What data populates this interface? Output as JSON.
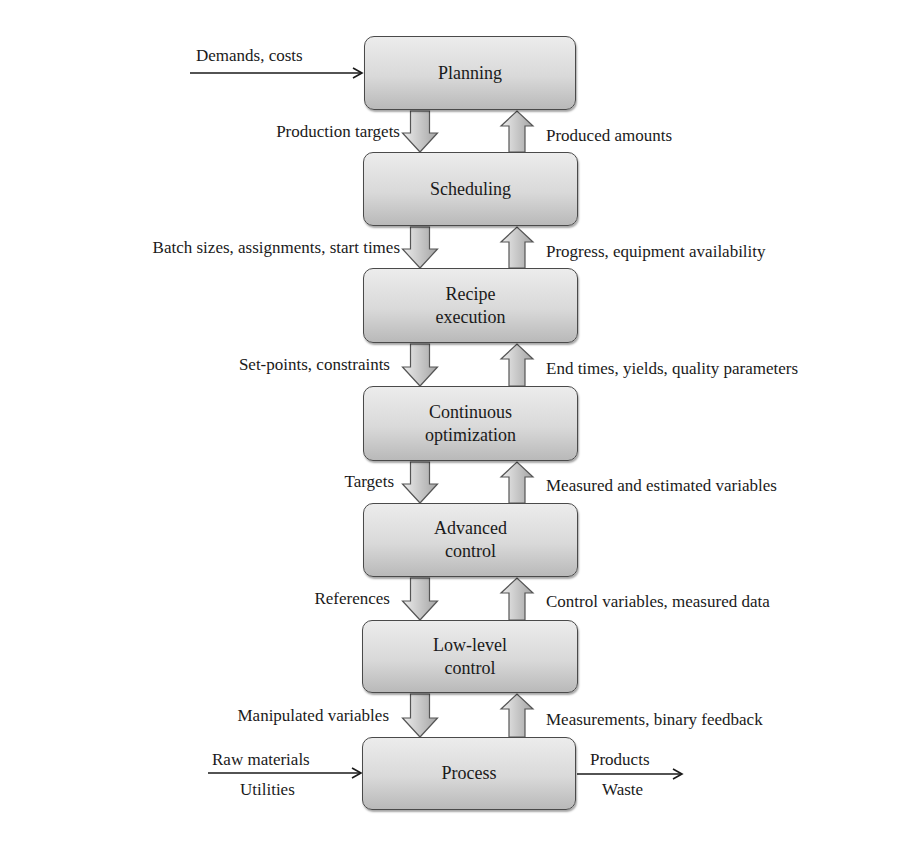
{
  "diagram": {
    "layers": [
      {
        "id": "planning",
        "lines": [
          "Planning"
        ],
        "top": 36,
        "bottom": 110
      },
      {
        "id": "scheduling",
        "lines": [
          "Scheduling"
        ],
        "top": 152,
        "bottom": 226
      },
      {
        "id": "recipe-execution",
        "lines": [
          "Recipe",
          "execution"
        ],
        "top": 268,
        "bottom": 343
      },
      {
        "id": "continuous-optimization",
        "lines": [
          "Continuous",
          "optimization"
        ],
        "top": 386,
        "bottom": 461
      },
      {
        "id": "advanced-control",
        "lines": [
          "Advanced",
          "control"
        ],
        "top": 503,
        "bottom": 577
      },
      {
        "id": "low-level-control",
        "lines": [
          "Low-level",
          "control"
        ],
        "top": 620,
        "bottom": 693
      },
      {
        "id": "process",
        "lines": [
          "Process"
        ],
        "top": 737,
        "bottom": 810
      }
    ],
    "downward_labels": [
      "Production targets",
      "Batch sizes, assignments, start times",
      "Set-points, constraints",
      "Targets",
      "References",
      "Manipulated variables"
    ],
    "upward_labels": [
      "Produced amounts",
      "Progress, equipment availability",
      "End times, yields, quality parameters",
      "Measured and estimated variables",
      "Control variables, measured data",
      "Measurements, binary feedback"
    ],
    "external_inputs": {
      "planning": "Demands, costs",
      "process_top": "Raw materials",
      "process_bottom": "Utilities"
    },
    "external_outputs": {
      "process_top": "Products",
      "process_bottom": "Waste"
    }
  },
  "colors": {
    "box_top": "#ececec",
    "box_bottom": "#b9b9b9",
    "box_border": "#4a4a4a",
    "arrow_fill_light": "#e6e6e6",
    "arrow_fill_dark": "#a8a8a8",
    "text": "#1a1a1a"
  }
}
